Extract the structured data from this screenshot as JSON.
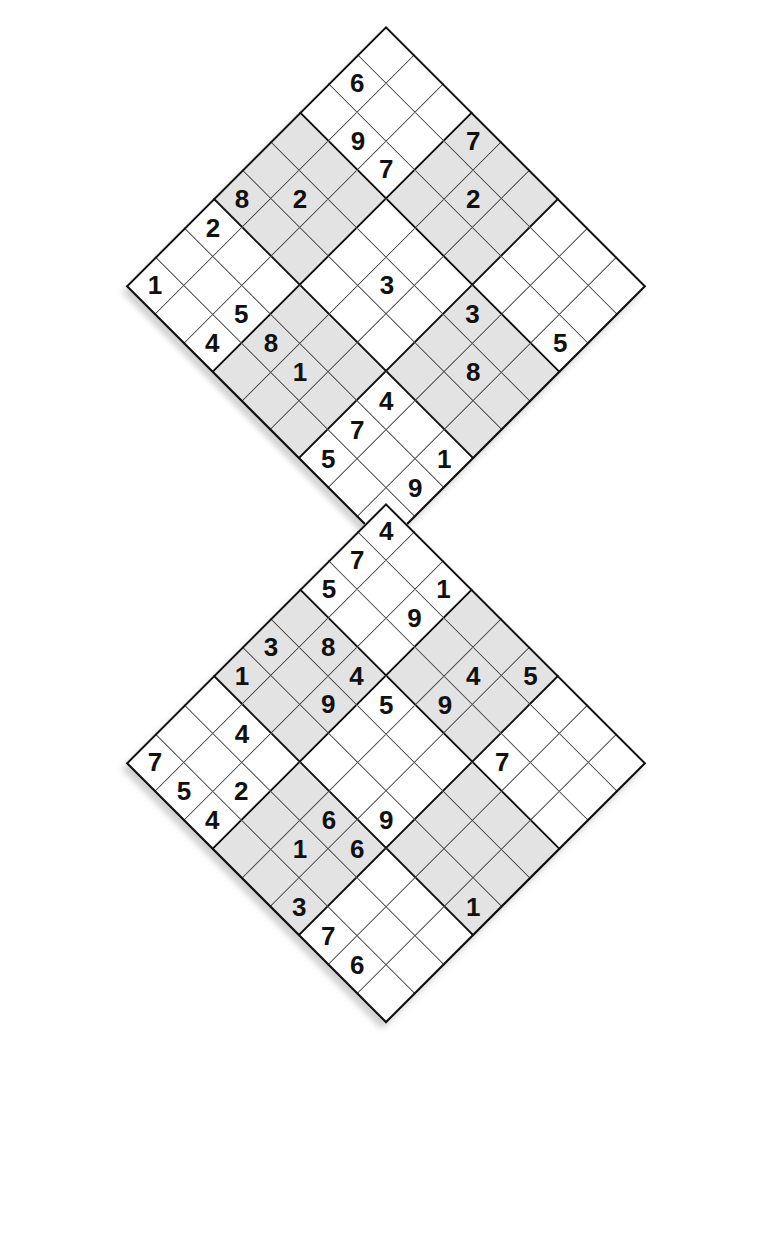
{
  "puzzle": {
    "title": "Samurai Sudoku (two overlapping diagonal 9x9 grids)",
    "type": "sudoku",
    "grid_size": 9,
    "box_size": 3,
    "rotation_degrees": 45,
    "grid_count": 2,
    "overlap": {
      "description": "bottom-right 3x3 box of the upper grid is the top-left 3x3 box of the lower grid",
      "upper_rows": [
        6,
        7,
        8
      ],
      "upper_cols": [
        6,
        7,
        8
      ],
      "lower_rows": [
        0,
        1,
        2
      ],
      "lower_cols": [
        0,
        1,
        2
      ]
    },
    "colors": {
      "page_background": "#ffffff",
      "cell_background": "#ffffff",
      "shaded_box_background": "#e3e3e3",
      "thin_line": "#3a3a3a",
      "thick_line": "#111111",
      "digit": "#111111",
      "drop_shadow": "#c9c9c9"
    },
    "shaded_boxes": [
      [
        0,
        1
      ],
      [
        1,
        0
      ],
      [
        1,
        2
      ],
      [
        2,
        1
      ]
    ]
  },
  "grids": [
    {
      "name": "upper-grid",
      "apex_px": [
        386,
        26
      ],
      "rows": [
        [
          null,
          null,
          null,
          "7",
          null,
          null,
          null,
          null,
          null
        ],
        [
          "6",
          null,
          null,
          null,
          "2",
          null,
          null,
          null,
          null
        ],
        [
          null,
          "9",
          "7",
          null,
          null,
          null,
          null,
          null,
          "5"
        ],
        [
          null,
          null,
          null,
          null,
          null,
          null,
          "3",
          null,
          null
        ],
        [
          null,
          "2",
          null,
          null,
          "3",
          null,
          null,
          "8",
          null
        ],
        [
          "8",
          null,
          null,
          null,
          null,
          null,
          null,
          null,
          null
        ],
        [
          "2",
          null,
          null,
          null,
          null,
          null,
          "4",
          null,
          "1"
        ],
        [
          null,
          null,
          "5",
          "8",
          "1",
          null,
          "7",
          null,
          "9"
        ],
        [
          "1",
          null,
          "4",
          null,
          null,
          null,
          "5",
          null,
          null
        ]
      ]
    },
    {
      "name": "lower-grid",
      "apex_px": [
        386,
        503
      ],
      "rows": [
        [
          "4",
          null,
          "1",
          null,
          null,
          "5",
          null,
          null,
          null
        ],
        [
          "7",
          null,
          "9",
          null,
          "4",
          null,
          null,
          null,
          null
        ],
        [
          "5",
          null,
          null,
          null,
          "9",
          null,
          "7",
          null,
          null
        ],
        [
          null,
          "8",
          "4",
          "5",
          null,
          null,
          null,
          null,
          null
        ],
        [
          "3",
          null,
          "9",
          null,
          null,
          null,
          null,
          null,
          null
        ],
        [
          "1",
          null,
          null,
          null,
          null,
          "9",
          null,
          null,
          "1"
        ],
        [
          null,
          "4",
          null,
          null,
          "6",
          "6",
          null,
          null,
          null
        ],
        [
          null,
          null,
          "2",
          null,
          "1",
          null,
          null,
          null,
          null
        ],
        [
          "7",
          "5",
          "4",
          null,
          null,
          "3",
          "7",
          "6",
          null
        ]
      ]
    }
  ],
  "digits_present": [
    "1",
    "2",
    "3",
    "4",
    "5",
    "6",
    "7",
    "8",
    "9"
  ]
}
